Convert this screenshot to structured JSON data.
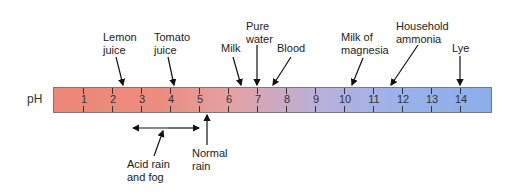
{
  "diagram": {
    "axis_label": "pH",
    "scale": [
      "1",
      "2",
      "3",
      "4",
      "5",
      "6",
      "7",
      "8",
      "9",
      "10",
      "11",
      "12",
      "13",
      "14"
    ],
    "colors": {
      "acid_end": "#ee8676",
      "neutral": "#cfa8c0",
      "base_end": "#8aaeea"
    },
    "markers_above": [
      {
        "line1": "Lemon",
        "line2": "juice",
        "ph": 2.4
      },
      {
        "line1": "Tomato",
        "line2": "juice",
        "ph": 4.2
      },
      {
        "line1": "Milk",
        "line2": "",
        "ph": 6.5
      },
      {
        "line1": "Pure",
        "line2": "water",
        "ph": 7.0
      },
      {
        "line1": "Blood",
        "line2": "",
        "ph": 7.5
      },
      {
        "line1": "Milk of",
        "line2": "magnesia",
        "ph": 10.3
      },
      {
        "line1": "Household",
        "line2": "ammonia",
        "ph": 11.6
      },
      {
        "line1": "Lye",
        "line2": "",
        "ph": 14
      }
    ],
    "markers_below": [
      {
        "line1": "Acid rain",
        "line2": "and fog",
        "range": [
          2.5,
          4.8
        ]
      },
      {
        "line1": "Normal",
        "line2": "rain",
        "ph": 5.6
      }
    ]
  }
}
